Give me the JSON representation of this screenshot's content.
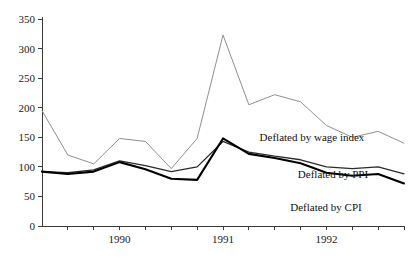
{
  "chart_data": {
    "type": "line",
    "title": "",
    "xlabel": "",
    "ylabel": "",
    "grid": false,
    "legend_position": "inline-annotations",
    "ylim": [
      0,
      350
    ],
    "y_ticks": [
      0,
      50,
      100,
      150,
      200,
      250,
      300,
      350
    ],
    "y_tick_labels": [
      "0",
      "50",
      "100",
      "150",
      "200",
      "250",
      "300",
      "350"
    ],
    "xlim": [
      1989.25,
      1992.75
    ],
    "x_tick_values": [
      1989.5,
      1989.75,
      1990.0,
      1990.25,
      1990.5,
      1990.75,
      1991.0,
      1991.25,
      1991.5,
      1991.75,
      1992.0,
      1992.25,
      1992.5,
      1992.75
    ],
    "x_labeled_ticks": [
      {
        "value": 1990.0,
        "label": "1990"
      },
      {
        "value": 1991.0,
        "label": "1991"
      },
      {
        "value": 1992.0,
        "label": "1992"
      }
    ],
    "x": [
      1989.25,
      1989.5,
      1989.75,
      1990.0,
      1990.25,
      1990.5,
      1990.75,
      1991.0,
      1991.25,
      1991.5,
      1991.75,
      1992.0,
      1992.25,
      1992.5,
      1992.75
    ],
    "series": [
      {
        "name": "Deflated by wage index",
        "color": "#8f8f8f",
        "label_text": "Deflated by wage index",
        "values": [
          195,
          120,
          105,
          148,
          143,
          97,
          148,
          323,
          205,
          222,
          210,
          170,
          150,
          160,
          140
        ]
      },
      {
        "name": "Deflated by PPI",
        "color": "#2b2b2b",
        "label_text": "Deflated by PPI",
        "values": [
          92,
          90,
          95,
          110,
          102,
          92,
          100,
          143,
          125,
          118,
          112,
          100,
          97,
          100,
          88
        ]
      },
      {
        "name": "Deflated by CPI",
        "color": "#000000",
        "label_text": "Deflated by CPI",
        "values": [
          92,
          88,
          92,
          108,
          96,
          80,
          78,
          148,
          122,
          115,
          106,
          90,
          85,
          88,
          72
        ]
      }
    ],
    "annotations": [
      {
        "name": "wage-index-label",
        "text": "Deflated by wage index",
        "x_px": 312,
        "y_px": 141
      },
      {
        "name": "ppi-label",
        "text": "Deflated by PPI",
        "x_px": 333,
        "y_px": 178
      },
      {
        "name": "cpi-label",
        "text": "Deflated by CPI",
        "x_px": 326,
        "y_px": 211
      }
    ]
  }
}
